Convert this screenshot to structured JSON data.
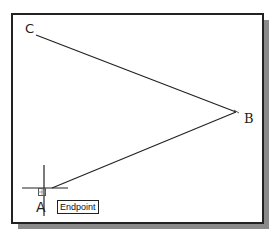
{
  "drawing": {
    "points": {
      "A": {
        "label": "A",
        "x": 44,
        "y": 189
      },
      "B": {
        "label": "B",
        "x": 237,
        "y": 112
      },
      "C": {
        "label": "C",
        "x": 35,
        "y": 35
      }
    },
    "lines": [
      {
        "from": "C",
        "to": "B"
      },
      {
        "from": "B",
        "to": "A"
      }
    ],
    "cursor": {
      "type": "crosshair",
      "x": 44,
      "y": 188
    },
    "snap_marker": {
      "type": "endpoint-box"
    },
    "tooltip": {
      "label": "Endpoint"
    }
  },
  "colors": {
    "line": "#222222",
    "frame": "#222222",
    "shadow": "#8a8a8a",
    "background": "#ffffff"
  }
}
